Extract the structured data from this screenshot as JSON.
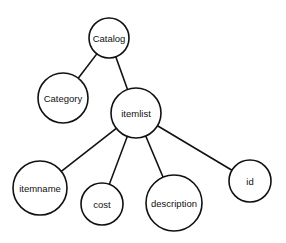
{
  "diagram": {
    "type": "tree",
    "colors": {
      "stroke": "#111111",
      "fill": "#ffffff",
      "background": "#ffffff"
    },
    "nodes": [
      {
        "id": "catalog",
        "label": "Catalog",
        "cx": 109,
        "cy": 38,
        "r": 20
      },
      {
        "id": "category",
        "label": "Category",
        "cx": 63,
        "cy": 98,
        "r": 25
      },
      {
        "id": "itemlist",
        "label": "itemlist",
        "cx": 136,
        "cy": 113,
        "r": 25
      },
      {
        "id": "itemname",
        "label": "itemname",
        "cx": 40,
        "cy": 188,
        "r": 27
      },
      {
        "id": "cost",
        "label": "cost",
        "cx": 102,
        "cy": 204,
        "r": 21
      },
      {
        "id": "description",
        "label": "description",
        "cx": 174,
        "cy": 203,
        "r": 28
      },
      {
        "id": "id",
        "label": "id",
        "cx": 250,
        "cy": 181,
        "r": 21
      }
    ],
    "edges": [
      {
        "from": "catalog",
        "to": "category"
      },
      {
        "from": "catalog",
        "to": "itemlist"
      },
      {
        "from": "itemlist",
        "to": "itemname"
      },
      {
        "from": "itemlist",
        "to": "cost"
      },
      {
        "from": "itemlist",
        "to": "description"
      },
      {
        "from": "itemlist",
        "to": "id"
      }
    ]
  }
}
